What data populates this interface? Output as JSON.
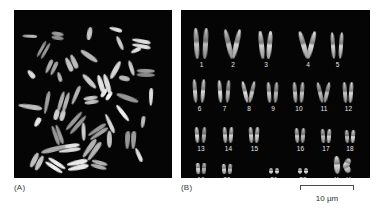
{
  "figure": {
    "background_color": "#ffffff",
    "panel_background_color": "#050505",
    "chromosome_color": "#c9c9c9",
    "label_color": "#3a3a3a"
  },
  "panels": [
    {
      "id": "A",
      "label": "(A)",
      "caption": "metaphase chromosome spread",
      "kind": "spread"
    },
    {
      "id": "B",
      "label": "(B)",
      "caption": "karyotype",
      "kind": "karyotype"
    }
  ],
  "karyotype": {
    "label_text_color": "#e8e8e8",
    "rows": [
      {
        "row_index": 0,
        "pairs": [
          {
            "label": "1",
            "x": 11,
            "width": 19,
            "height": 31,
            "shape": "metacentric-long"
          },
          {
            "label": "2",
            "x": 42,
            "width": 20,
            "height": 30,
            "shape": "submetacentric-open"
          },
          {
            "label": "3",
            "x": 76,
            "width": 18,
            "height": 28,
            "shape": "metacentric"
          },
          {
            "label": "4",
            "x": 118,
            "width": 18,
            "height": 28,
            "shape": "submetacentric-splayed"
          },
          {
            "label": "5",
            "x": 148,
            "width": 17,
            "height": 27,
            "shape": "submetacentric"
          }
        ]
      },
      {
        "row_index": 1,
        "pairs": [
          {
            "label": "6",
            "x": 10,
            "width": 17,
            "height": 24,
            "shape": "submetacentric"
          },
          {
            "label": "7",
            "x": 35,
            "width": 17,
            "height": 23,
            "shape": "submetacentric"
          },
          {
            "label": "8",
            "x": 60,
            "width": 16,
            "height": 22,
            "shape": "submetacentric-open"
          },
          {
            "label": "9",
            "x": 84,
            "width": 16,
            "height": 21,
            "shape": "submetacentric"
          },
          {
            "label": "10",
            "x": 110,
            "width": 16,
            "height": 21,
            "shape": "submetacentric"
          },
          {
            "label": "11",
            "x": 135,
            "width": 16,
            "height": 21,
            "shape": "submetacentric-open"
          },
          {
            "label": "12",
            "x": 160,
            "width": 15,
            "height": 21,
            "shape": "submetacentric"
          }
        ]
      },
      {
        "row_index": 2,
        "pairs": [
          {
            "label": "13",
            "x": 12,
            "width": 16,
            "height": 16,
            "shape": "acrocentric"
          },
          {
            "label": "14",
            "x": 40,
            "width": 15,
            "height": 16,
            "shape": "acrocentric"
          },
          {
            "label": "15",
            "x": 66,
            "width": 15,
            "height": 16,
            "shape": "acrocentric"
          },
          {
            "label": "16",
            "x": 112,
            "width": 15,
            "height": 15,
            "shape": "metacentric-small"
          },
          {
            "label": "17",
            "x": 138,
            "width": 14,
            "height": 14,
            "shape": "metacentric-small"
          },
          {
            "label": "18",
            "x": 162,
            "width": 14,
            "height": 13,
            "shape": "metacentric-small"
          }
        ]
      },
      {
        "row_index": 3,
        "pairs": [
          {
            "label": "19",
            "x": 13,
            "width": 14,
            "height": 11,
            "shape": "metacentric-small"
          },
          {
            "label": "20",
            "x": 39,
            "width": 14,
            "height": 10,
            "shape": "metacentric-small"
          },
          {
            "label": "21",
            "x": 86,
            "width": 14,
            "height": 6,
            "shape": "dot-pair"
          },
          {
            "label": "22",
            "x": 115,
            "width": 14,
            "height": 6,
            "shape": "dot-pair"
          },
          {
            "label": "X Y",
            "x": 152,
            "width": 22,
            "height": 18,
            "shape": "sex-pair"
          }
        ]
      }
    ]
  },
  "scalebar": {
    "text": "10 µm",
    "length_label": "10",
    "unit": "µm",
    "color": "#4a4a4a"
  },
  "spread": {
    "count": 46,
    "description": "scattered metaphase chromosomes on dark background"
  }
}
